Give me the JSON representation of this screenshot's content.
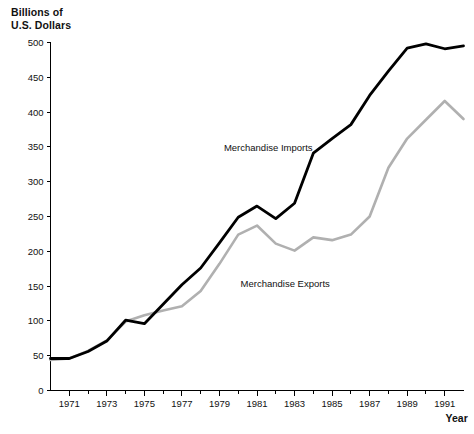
{
  "axis_titles": {
    "y_line1": "Billions of",
    "y_line2": "U.S. Dollars",
    "x": "Year"
  },
  "y_ticks": [
    "0",
    "50",
    "100",
    "150",
    "200",
    "250",
    "300",
    "350",
    "400",
    "450",
    "500"
  ],
  "x_ticks": [
    "1971",
    "1973",
    "1975",
    "1977",
    "1979",
    "1981",
    "1983",
    "1985",
    "1987",
    "1989",
    "1991"
  ],
  "series_labels": {
    "imports": "Merchandise Imports",
    "exports": "Merchandise Exports"
  },
  "colors": {
    "imports": "#000000",
    "exports": "#b0b0b0",
    "axis": "#000000",
    "background": "#ffffff"
  },
  "chart_data": {
    "type": "line",
    "title": "",
    "xlabel": "Year",
    "ylabel": "Billions of U.S. Dollars",
    "xlim": [
      1970,
      1992
    ],
    "ylim": [
      0,
      500
    ],
    "grid": false,
    "legend": "inline-annotations",
    "x": [
      1970,
      1971,
      1972,
      1973,
      1974,
      1975,
      1976,
      1977,
      1978,
      1979,
      1980,
      1981,
      1982,
      1983,
      1984,
      1985,
      1986,
      1987,
      1988,
      1989,
      1990,
      1991,
      1992
    ],
    "series": [
      {
        "name": "Merchandise Imports",
        "color": "#000000",
        "values": [
          46,
          46,
          56,
          71,
          101,
          96,
          124,
          152,
          176,
          212,
          249,
          265,
          247,
          269,
          341,
          362,
          382,
          424,
          459,
          492,
          498,
          491,
          495
        ]
      },
      {
        "name": "Merchandise Exports",
        "color": "#b0b0b0",
        "values": [
          44,
          46,
          57,
          72,
          99,
          108,
          115,
          121,
          143,
          182,
          224,
          237,
          211,
          201,
          220,
          216,
          224,
          250,
          320,
          362,
          389,
          416,
          390
        ]
      }
    ],
    "annotations": [
      {
        "text": "Merchandise Imports",
        "x": 1981.6,
        "y": 344
      },
      {
        "text": "Merchandise Exports",
        "x": 1982.5,
        "y": 148
      }
    ]
  }
}
